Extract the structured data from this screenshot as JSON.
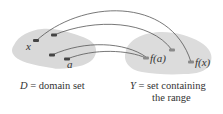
{
  "diagram": {
    "domain_set": {
      "caption_var": "D",
      "caption_text": "= domain set",
      "points": [
        "x",
        "a"
      ]
    },
    "codomain_set": {
      "caption_var": "Y",
      "caption_line1": "= set containing",
      "caption_line2": "the range",
      "images": [
        "f(a)",
        "f(x)"
      ]
    },
    "arrows": [
      {
        "from": "x",
        "to": "f(x)"
      },
      {
        "from": "unlabeled-1",
        "to": "unlabeled-image"
      },
      {
        "from": "unlabeled-2",
        "to": "f(a)"
      },
      {
        "from": "a",
        "to": "f(a)"
      }
    ],
    "colors": {
      "blob": "#d9d9d9",
      "curve": "#555555",
      "point": "#444444",
      "image_point": "#8a8a8a"
    }
  }
}
